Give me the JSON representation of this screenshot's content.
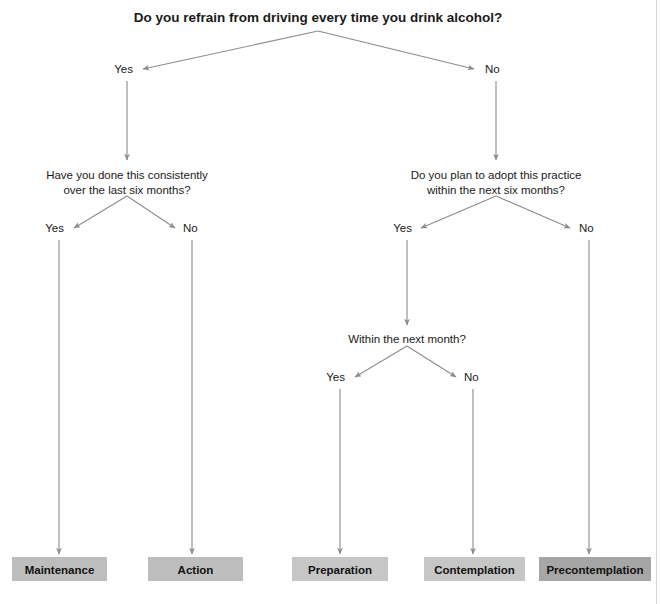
{
  "title": "Do you refrain from driving every time you drink alcohol?",
  "colors": {
    "connector": "#8c8c8c",
    "text": "#1a1a1a",
    "box_light": "#c6c6c6",
    "box_mid": "#bdbdbd",
    "box_dark": "#a6a6a6",
    "background": "#ffffff"
  },
  "questions": [
    {
      "id": "root",
      "lines": [
        "Do you refrain from driving every time you drink alcohol?"
      ],
      "x": 318,
      "y": 18
    },
    {
      "id": "left-branch",
      "lines": [
        "Have you done this consistently",
        "over the last six months?"
      ],
      "x": 127,
      "y": 175
    },
    {
      "id": "right-branch",
      "lines": [
        "Do you plan to adopt this practice",
        "within the next six months?"
      ],
      "x": 496,
      "y": 175
    },
    {
      "id": "month-branch",
      "lines": [
        "Within the next month?"
      ],
      "x": 407,
      "y": 339
    }
  ],
  "branch_labels": [
    {
      "id": "root-yes",
      "text": "Yes",
      "x": 133,
      "y": 73,
      "align": "end"
    },
    {
      "id": "root-no",
      "text": "No",
      "x": 485,
      "y": 73,
      "align": "start"
    },
    {
      "id": "left-yes",
      "text": "Yes",
      "x": 64,
      "y": 232,
      "align": "end"
    },
    {
      "id": "left-no",
      "text": "No",
      "x": 183,
      "y": 232,
      "align": "start"
    },
    {
      "id": "right-yes",
      "text": "Yes",
      "x": 412,
      "y": 232,
      "align": "end"
    },
    {
      "id": "right-no",
      "text": "No",
      "x": 579,
      "y": 232,
      "align": "start"
    },
    {
      "id": "month-yes",
      "text": "Yes",
      "x": 345,
      "y": 381,
      "align": "end"
    },
    {
      "id": "month-no",
      "text": "No",
      "x": 464,
      "y": 381,
      "align": "start"
    }
  ],
  "outcomes": [
    {
      "id": "maintenance",
      "label": "Maintenance",
      "x": 12,
      "y": 557,
      "width": 95,
      "height": 24,
      "shade": "box_mid"
    },
    {
      "id": "action",
      "label": "Action",
      "x": 148,
      "y": 557,
      "width": 95,
      "height": 24,
      "shade": "box_mid"
    },
    {
      "id": "preparation",
      "label": "Preparation",
      "x": 292,
      "y": 557,
      "width": 96,
      "height": 24,
      "shade": "box_light"
    },
    {
      "id": "contemplation",
      "label": "Contemplation",
      "x": 424,
      "y": 557,
      "width": 101,
      "height": 24,
      "shade": "box_light"
    },
    {
      "id": "precontemplation",
      "label": "Precontemplation",
      "x": 539,
      "y": 557,
      "width": 112,
      "height": 24,
      "shade": "box_dark"
    }
  ]
}
